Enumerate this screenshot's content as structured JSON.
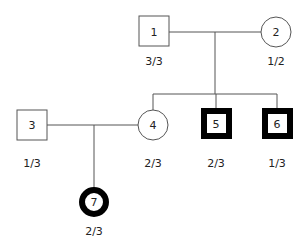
{
  "pedigree": {
    "individuals": [
      {
        "id": "1",
        "sex": "male",
        "affected": false,
        "genotype": "3/3",
        "generation": 1
      },
      {
        "id": "2",
        "sex": "female",
        "affected": false,
        "genotype": "1/2",
        "generation": 1
      },
      {
        "id": "3",
        "sex": "male",
        "affected": false,
        "genotype": "1/3",
        "generation": 2
      },
      {
        "id": "4",
        "sex": "female",
        "affected": false,
        "genotype": "2/3",
        "generation": 2
      },
      {
        "id": "5",
        "sex": "male",
        "affected": true,
        "genotype": "2/3",
        "generation": 2
      },
      {
        "id": "6",
        "sex": "male",
        "affected": true,
        "genotype": "1/3",
        "generation": 2
      },
      {
        "id": "7",
        "sex": "female",
        "affected": true,
        "genotype": "2/3",
        "generation": 3
      }
    ],
    "couples": [
      {
        "partners": [
          "1",
          "2"
        ],
        "children": [
          "4",
          "5",
          "6"
        ]
      },
      {
        "partners": [
          "3",
          "4"
        ],
        "children": [
          "7"
        ]
      }
    ]
  },
  "nodes": {
    "n1": {
      "label": "1",
      "genotype": "3/3"
    },
    "n2": {
      "label": "2",
      "genotype": "1/2"
    },
    "n3": {
      "label": "3",
      "genotype": "1/3"
    },
    "n4": {
      "label": "4",
      "genotype": "2/3"
    },
    "n5": {
      "label": "5",
      "genotype": "2/3"
    },
    "n6": {
      "label": "6",
      "genotype": "1/3"
    },
    "n7": {
      "label": "7",
      "genotype": "2/3"
    }
  },
  "colors": {
    "line": "#555555",
    "affected_border": "#000000",
    "background": "#ffffff"
  }
}
